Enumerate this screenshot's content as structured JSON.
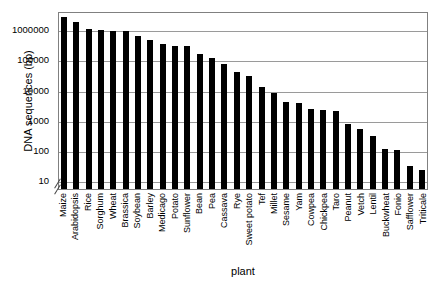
{
  "chart_data": {
    "type": "bar",
    "title": "",
    "xlabel": "plant",
    "ylabel": "DNA sequences (bp)",
    "yscale": "log",
    "ylim": [
      5,
      4000000
    ],
    "grid": true,
    "legend": null,
    "axis_break": true,
    "ytick_labels": [
      "10",
      "100",
      "1000",
      "10000",
      "100000",
      "1000000"
    ],
    "ytick_values": [
      10,
      100,
      1000,
      10000,
      100000,
      1000000
    ],
    "categories": [
      "Maize",
      "Arabidopsis",
      "Rice",
      "Sorghum",
      "Wheat",
      "Brassica",
      "Soybean",
      "Barley",
      "Medicago",
      "Potato",
      "Sunflower",
      "Bean",
      "Pea",
      "Cassava",
      "Rye",
      "Sweet potato",
      "Tef",
      "Millet",
      "Sesame",
      "Yam",
      "Cowpea",
      "Chickpea",
      "Taro",
      "Peanut",
      "Vetch",
      "Lentil",
      "Buckwheat",
      "Fonio",
      "Safflower",
      "Triticale"
    ],
    "values": [
      2500000,
      1700000,
      1050000,
      950000,
      850000,
      850000,
      600000,
      430000,
      330000,
      280000,
      270000,
      150000,
      110000,
      70000,
      38000,
      28000,
      12000,
      7500,
      4000,
      3600,
      2200,
      2100,
      2000,
      700,
      500,
      290,
      110,
      100,
      30,
      22
    ]
  }
}
